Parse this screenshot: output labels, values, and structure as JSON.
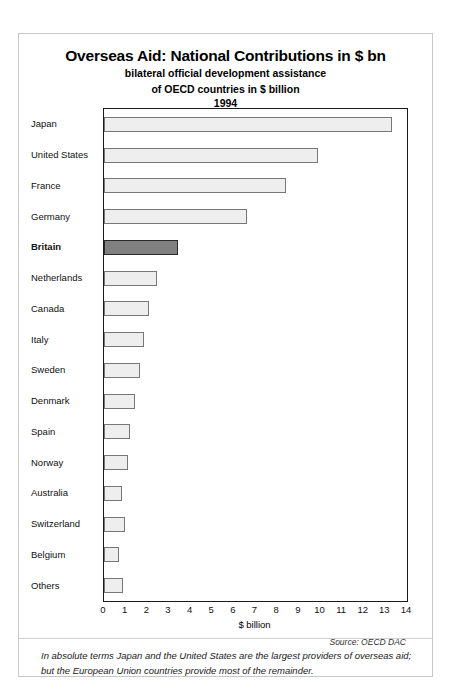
{
  "chart_data": {
    "type": "bar",
    "orientation": "horizontal",
    "title": "Overseas Aid: National Contributions in $ bn",
    "subtitle_line1": "bilateral official development assistance",
    "subtitle_line2": "of OECD countries in $ billion",
    "subtitle_year": "1994",
    "xlabel": "$ billion",
    "ylabel": "",
    "xlim": [
      0,
      14
    ],
    "xticks": [
      "0",
      "1",
      "2",
      "3",
      "4",
      "5",
      "6",
      "7",
      "8",
      "9",
      "10",
      "11",
      "12",
      "13",
      "14"
    ],
    "grid": false,
    "legend": null,
    "source": "Source: OECD DAC",
    "highlight_category": "Britain",
    "categories": [
      "Japan",
      "United States",
      "France",
      "Germany",
      "Britain",
      "Netherlands",
      "Canada",
      "Italy",
      "Sweden",
      "Denmark",
      "Spain",
      "Norway",
      "Australia",
      "Switzerland",
      "Belgium",
      "Others"
    ],
    "values": [
      13.3,
      9.9,
      8.4,
      6.6,
      3.4,
      2.45,
      2.1,
      1.85,
      1.65,
      1.45,
      1.2,
      1.1,
      0.85,
      0.95,
      0.7,
      0.9
    ],
    "colors": {
      "bar_fill": "#eeeeee",
      "bar_border": "#777777",
      "highlight_fill": "#808080",
      "highlight_border": "#2b2b2b",
      "frame": "#1a1a1a",
      "card_border": "#c8c8c8",
      "background": "#ffffff"
    }
  },
  "footnote": "In absolute terms Japan and the United States are the largest providers of overseas aid; but the European Union countries provide most of the remainder."
}
